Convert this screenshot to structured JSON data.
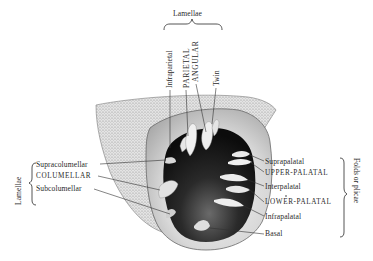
{
  "figure": {
    "top_group": {
      "label": "Lamellae",
      "items": [
        "Infraparietal",
        "PARIETAL",
        "ANGULAR",
        "Twin"
      ]
    },
    "left_group": {
      "label": "Lamellae",
      "items": [
        "Supracolumellar",
        "COLUMELLAR",
        "Subcolumellar"
      ]
    },
    "right_group": {
      "label": "Folds or plicae",
      "items": [
        "Suprapalatal",
        "UPPER-PALATAL",
        "Interpalatal",
        "LOWER-PALATAL",
        "Infrapalatal",
        "Basal"
      ]
    },
    "colors": {
      "ink": "#2a2a2a",
      "shell_shade": "#bdbdbd",
      "aperture_dark": "#161616",
      "background": "#ffffff"
    }
  }
}
